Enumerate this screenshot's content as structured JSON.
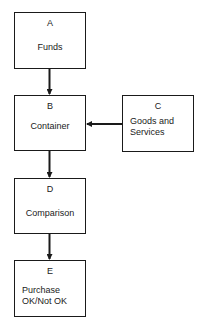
{
  "diagram": {
    "nodes": [
      {
        "id": "A",
        "letter": "A",
        "label": "Funds"
      },
      {
        "id": "B",
        "letter": "B",
        "label": "Container"
      },
      {
        "id": "C",
        "letter": "C",
        "label_line1": "Goods and",
        "label_line2": "Services"
      },
      {
        "id": "D",
        "letter": "D",
        "label": "Comparison"
      },
      {
        "id": "E",
        "letter": "E",
        "label_line1": "Purchase",
        "label_line2": "OK/Not OK"
      }
    ],
    "edges": [
      {
        "from": "A",
        "to": "B"
      },
      {
        "from": "C",
        "to": "B"
      },
      {
        "from": "B",
        "to": "D"
      },
      {
        "from": "D",
        "to": "E"
      }
    ]
  }
}
